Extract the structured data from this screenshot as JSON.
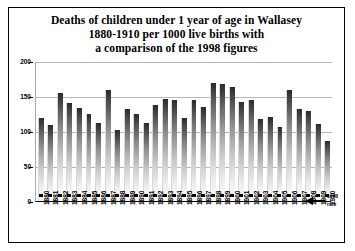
{
  "chart_data": {
    "type": "bar",
    "title": "Deaths of children under 1 year of age in Wallasey 1880-1910 per 1000 live births with a comparison of the 1998 figures",
    "title_lines": [
      "Deaths of children under 1 year of age in Wallasey",
      "1880-1910 per 1000 live births with",
      "a comparison of the 1998 figures"
    ],
    "xlabel": "",
    "ylabel": "",
    "ylim": [
      0,
      200
    ],
    "yticks": [
      0,
      50,
      100,
      150,
      200
    ],
    "ytick_labels": [
      "0",
      "50",
      "100",
      "150",
      "200"
    ],
    "grid": true,
    "legend": false,
    "categories": [
      "1880",
      "1881",
      "1882",
      "1883",
      "1884",
      "1885",
      "1886",
      "1887",
      "1888",
      "1889",
      "1890",
      "1891",
      "1892",
      "1893",
      "1894",
      "1895",
      "1896",
      "1897",
      "1898",
      "1899",
      "1900",
      "1901",
      "1902",
      "1903",
      "1904",
      "1905",
      "1906",
      "1907",
      "1908",
      "1909",
      "1910"
    ],
    "series": [
      {
        "name": "Infant mortality rate",
        "values": [
          118,
          109,
          154,
          140,
          133,
          125,
          112,
          158,
          102,
          131,
          124,
          111,
          137,
          146,
          145,
          118,
          145,
          134,
          169,
          167,
          163,
          141,
          144,
          117,
          120,
          106,
          158,
          131,
          129,
          110,
          86
        ]
      },
      {
        "name": "1998 rate",
        "values": [
          6,
          6,
          6,
          6,
          6,
          6,
          6,
          6,
          6,
          6,
          6,
          6,
          6,
          6,
          6,
          6,
          6,
          6,
          6,
          6,
          6,
          6,
          6,
          6,
          6,
          6,
          6,
          6,
          6,
          6,
          6
        ],
        "style": "dotted-line"
      }
    ],
    "annotations": [
      {
        "text": "1998",
        "target": "1998-rate-line"
      },
      {
        "text": "rate",
        "target": "1998-rate-line"
      }
    ],
    "colors": {
      "bar_top": "#2b2b2b",
      "bar_bottom": "#fbfbfb",
      "grid": "#b9b9b9",
      "axis": "#000000",
      "background": "#ffffff"
    }
  }
}
